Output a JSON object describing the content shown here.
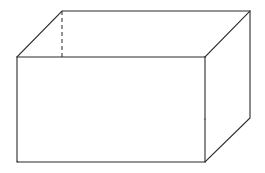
{
  "figure": {
    "kind": "geometry-diagram",
    "shape_name": "rectangular-prism",
    "canvas": {
      "width": 265,
      "height": 173,
      "background": "#ffffff"
    },
    "style": {
      "visible_edge_color": "#2b2b2b",
      "hidden_edge_color": "#3a3a3a",
      "face_fill": "#ffffff",
      "stroke_width": 1.1,
      "hidden_dash_pattern": "4 3"
    },
    "vertices": {
      "front_top_left": {
        "x": 17,
        "y": 57
      },
      "front_top_right": {
        "x": 205,
        "y": 57
      },
      "front_bottom_right": {
        "x": 205,
        "y": 162
      },
      "front_bottom_left": {
        "x": 17,
        "y": 162
      },
      "back_top_left": {
        "x": 62,
        "y": 11
      },
      "back_top_right": {
        "x": 250,
        "y": 11
      },
      "back_bottom_right": {
        "x": 250,
        "y": 118
      },
      "back_bottom_left": {
        "x": 62,
        "y": 119
      }
    },
    "edges_visible": [
      {
        "name": "front-top-edge",
        "from": "front_top_left",
        "to": "front_top_right"
      },
      {
        "name": "front-right-edge",
        "from": "front_top_right",
        "to": "front_bottom_right"
      },
      {
        "name": "front-bottom-edge",
        "from": "front_bottom_right",
        "to": "front_bottom_left"
      },
      {
        "name": "front-left-edge",
        "from": "front_bottom_left",
        "to": "front_top_left"
      },
      {
        "name": "back-top-edge",
        "from": "back_top_left",
        "to": "back_top_right"
      },
      {
        "name": "back-right-edge",
        "from": "back_top_right",
        "to": "back_bottom_right"
      },
      {
        "name": "top-left-depth-edge",
        "from": "front_top_left",
        "to": "back_top_left"
      },
      {
        "name": "top-right-depth-edge",
        "from": "front_top_right",
        "to": "back_top_right"
      },
      {
        "name": "bottom-right-depth-edge",
        "from": "front_bottom_right",
        "to": "back_bottom_right"
      }
    ],
    "edges_hidden": [
      {
        "name": "back-left-vertical-edge",
        "from": "back_top_left",
        "to": "back_bottom_left"
      },
      {
        "name": "back-bottom-edge",
        "from": "back_bottom_left",
        "to": "back_bottom_right"
      },
      {
        "name": "bottom-left-depth-edge",
        "from": "front_bottom_left",
        "to": "back_bottom_left"
      }
    ]
  }
}
